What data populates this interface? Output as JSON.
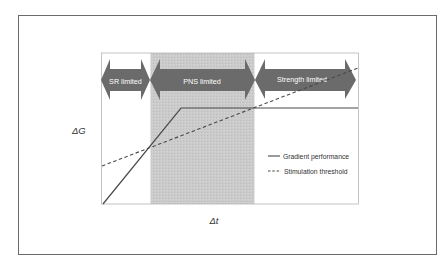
{
  "figure": {
    "y_axis_label": "ΔG",
    "x_axis_label": "Δt",
    "regions": [
      {
        "label": "SR limited",
        "shaded": false
      },
      {
        "label": "PNS limited",
        "shaded": true
      },
      {
        "label": "Strength limited",
        "shaded": false
      }
    ],
    "legend": [
      {
        "label": "Gradient performance",
        "style": "solid"
      },
      {
        "label": "Stimulation threshold",
        "style": "dashed"
      }
    ],
    "colors": {
      "arrow": "#6b6b6b",
      "arrow_text": "#ffffff",
      "shade": "#c8c8c8",
      "line": "#4a4a4a",
      "frame": "#6a6a6a"
    }
  }
}
